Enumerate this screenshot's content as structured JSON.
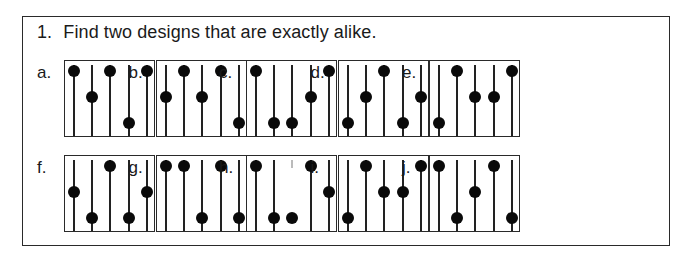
{
  "question": {
    "number": "1.",
    "text": "Find two designs that are exactly alike."
  },
  "designs": [
    {
      "label": "a.",
      "dots": [
        "top",
        "middle",
        "top",
        "bottom",
        "top"
      ]
    },
    {
      "label": "b.",
      "dots": [
        "middle",
        "top",
        "middle",
        "top",
        "bottom"
      ]
    },
    {
      "label": "c.",
      "dots": [
        "top",
        "bottom",
        "bottom",
        "middle",
        "top"
      ]
    },
    {
      "label": "d.",
      "dots": [
        "bottom",
        "middle",
        "top",
        "bottom",
        "middle"
      ]
    },
    {
      "label": "e.",
      "dots": [
        "bottom",
        "top",
        "middle",
        "middle",
        "top"
      ]
    },
    {
      "label": "f.",
      "dots": [
        "middle",
        "bottom",
        "top",
        "bottom",
        "middle"
      ]
    },
    {
      "label": "g.",
      "dots": [
        "top",
        "top",
        "bottom",
        "top",
        "bottom"
      ]
    },
    {
      "label": "h.",
      "dots": [
        "top",
        "bottom",
        "bottom",
        "top",
        "middle"
      ],
      "broken_lines": [
        2
      ]
    },
    {
      "label": "i.",
      "dots": [
        "bottom",
        "top",
        "middle",
        "middle",
        "top"
      ]
    },
    {
      "label": "j.",
      "dots": [
        "top",
        "bottom",
        "middle",
        "top",
        "bottom"
      ]
    }
  ]
}
